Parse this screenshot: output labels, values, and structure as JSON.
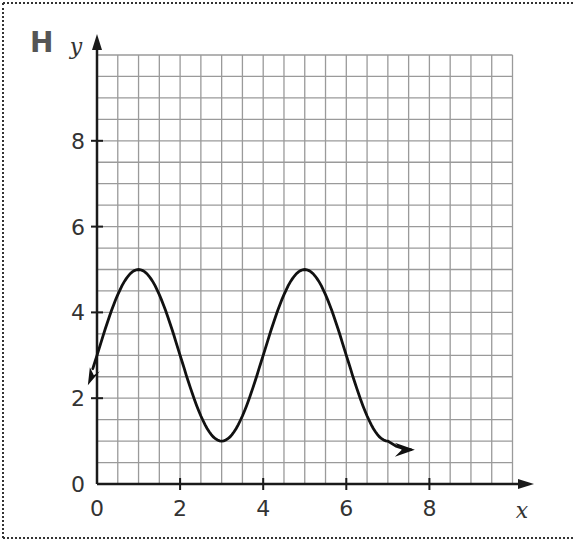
{
  "panel": {
    "label": "H"
  },
  "chart_data": {
    "type": "line",
    "title": "",
    "xlabel": "x",
    "ylabel": "y",
    "xlim": [
      0,
      10
    ],
    "ylim": [
      0,
      10
    ],
    "grid": true,
    "grid_step": 0.5,
    "x_ticks": [
      0,
      2,
      4,
      6,
      8
    ],
    "y_ticks": [
      0,
      2,
      4,
      6,
      8
    ],
    "x_tick_labels": [
      "0",
      "2",
      "4",
      "6",
      "8"
    ],
    "y_tick_labels": [
      "0",
      "2",
      "4",
      "6",
      "8"
    ],
    "series": [
      {
        "name": "curve",
        "description": "sinusoid y = 3 + 2cos(pi(x-1)/2), arrows at both ends",
        "key_points": [
          {
            "x": -0.2,
            "y": 2.3,
            "note": "start arrow"
          },
          {
            "x": 0,
            "y": 3
          },
          {
            "x": 1,
            "y": 5,
            "note": "maximum"
          },
          {
            "x": 2,
            "y": 3
          },
          {
            "x": 3,
            "y": 1,
            "note": "minimum"
          },
          {
            "x": 4,
            "y": 3
          },
          {
            "x": 5,
            "y": 5,
            "note": "maximum"
          },
          {
            "x": 6,
            "y": 3
          },
          {
            "x": 7,
            "y": 1
          },
          {
            "x": 7.6,
            "y": 0.8,
            "note": "end arrow"
          }
        ],
        "color": "#111111"
      }
    ],
    "colors": {
      "grid": "#9a9a9a",
      "axis": "#1a1a1a",
      "curve": "#111111"
    }
  }
}
